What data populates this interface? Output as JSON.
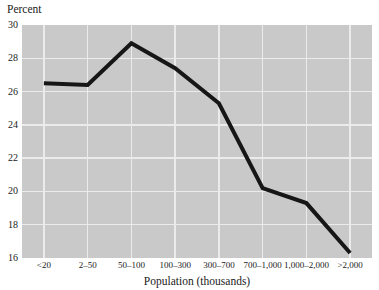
{
  "chart_data": {
    "type": "line",
    "title": "",
    "ylabel": "Percent",
    "xlabel": "Population (thousands)",
    "categories": [
      "<20",
      "2–50",
      "50–100",
      "100–300",
      "300–700",
      "700–1,000",
      "1,000–2,000",
      ">2,000"
    ],
    "series": [
      {
        "name": "percent-by-population",
        "values": [
          26.5,
          26.4,
          28.9,
          27.4,
          25.3,
          20.2,
          19.3,
          16.3
        ]
      }
    ],
    "ylim": [
      16,
      30
    ],
    "yticks": [
      16,
      18,
      20,
      22,
      24,
      26,
      28,
      30
    ],
    "grid": "both",
    "legend": "none",
    "colors": {
      "line": "#161616",
      "plot_bg": "#c8c9c8",
      "gridline": "#ebebeb",
      "text": "#1a1a1a",
      "page_bg": "#ffffff"
    }
  }
}
